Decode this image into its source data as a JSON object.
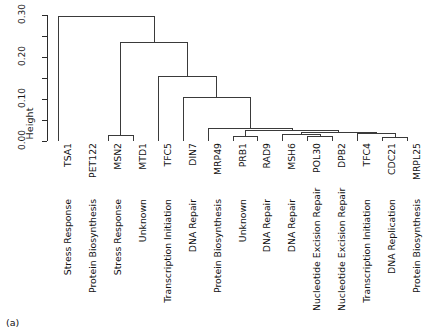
{
  "figure": {
    "caption": "(a)",
    "ylabel": "Height"
  },
  "chart_data": {
    "type": "dendrogram",
    "title": "",
    "xlabel": "",
    "ylabel": "Height",
    "ylim": [
      0.0,
      0.3
    ],
    "yticks": [
      0.0,
      0.05,
      0.1,
      0.15,
      0.2,
      0.25,
      0.3
    ],
    "ytick_labels": [
      "0.00",
      "",
      "0.10",
      "",
      "0.20",
      "",
      "0.30"
    ],
    "grid": false,
    "legend": "none",
    "n_leaves": 14,
    "leaf_order": [
      "TSA1",
      "PET122",
      "MSN2",
      "MTD1",
      "TFC5",
      "DIN7",
      "MRP49",
      "PRB1",
      "RAD9",
      "MSH6",
      "POL30",
      "DPB2",
      "TFC4",
      "CDC21",
      "MRPL25"
    ],
    "leaves": [
      {
        "label": "TSA1",
        "category": "Stress Response"
      },
      {
        "label": "PET122",
        "category": "Protein Biosynthesis"
      },
      {
        "label": "MSN2",
        "category": "Stress Response"
      },
      {
        "label": "MTD1",
        "category": "Unknown"
      },
      {
        "label": "TFC5",
        "category": "Transcription Initiation"
      },
      {
        "label": "DIN7",
        "category": "DNA Repair"
      },
      {
        "label": "MRP49",
        "category": "Protein Biosynthesis"
      },
      {
        "label": "PRB1",
        "category": "Unknown"
      },
      {
        "label": "RAD9",
        "category": "DNA Repair"
      },
      {
        "label": "MSH6",
        "category": "DNA Repair"
      },
      {
        "label": "POL30",
        "category": "Nucleotide Excision Repair"
      },
      {
        "label": "DPB2",
        "category": "Nucleotide Excision Repair"
      },
      {
        "label": "TFC4",
        "category": "Transcription Initiation"
      },
      {
        "label": "CDC21",
        "category": "DNA Replication"
      },
      {
        "label": "MRPL25",
        "category": "Protein Biosynthesis"
      }
    ],
    "merges": [
      {
        "id": "m1",
        "left": "MSN2",
        "right": "MTD1",
        "height": 0.015
      },
      {
        "id": "m2",
        "left": "PRB1",
        "right": "RAD9",
        "height": 0.012
      },
      {
        "id": "m3",
        "left": "POL30",
        "right": "DPB2",
        "height": 0.011
      },
      {
        "id": "m4",
        "left": "CDC21",
        "right": "MRPL25",
        "height": 0.01
      },
      {
        "id": "m5",
        "left": "TFC4",
        "right": "m4",
        "height": 0.018
      },
      {
        "id": "m6",
        "left": "MSH6",
        "right": "m3",
        "height": 0.017
      },
      {
        "id": "m7",
        "left": "m6",
        "right": "m5",
        "height": 0.022
      },
      {
        "id": "m8",
        "left": "m2",
        "right": "m7",
        "height": 0.026
      },
      {
        "id": "m9",
        "left": "MRP49",
        "right": "m8",
        "height": 0.03
      },
      {
        "id": "m10",
        "left": "DIN7",
        "right": "m9",
        "height": 0.105
      },
      {
        "id": "m11",
        "left": "TFC5",
        "right": "m10",
        "height": 0.155
      },
      {
        "id": "m12",
        "left": "m1",
        "right": "m11",
        "height": 0.235
      },
      {
        "id": "m13",
        "left": "TSA1",
        "right": "m12",
        "height": 0.298
      }
    ]
  }
}
